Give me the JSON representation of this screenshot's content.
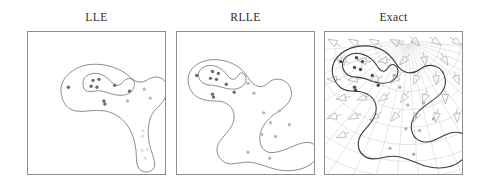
{
  "figure": {
    "width": 483,
    "height": 185,
    "background": "#ffffff",
    "panel_border_color": "#8d8d8d"
  },
  "panels": [
    {
      "id": "lle",
      "title": "LLE"
    },
    {
      "id": "rlle",
      "title": "RLLE"
    },
    {
      "id": "exact",
      "title": "Exact"
    }
  ],
  "chart_data": {
    "type": "scatter",
    "title": "",
    "xlabel": "",
    "ylabel": "",
    "grid": false,
    "legend": "none",
    "subplots": [
      {
        "name": "LLE",
        "xlim": [
          0,
          139
        ],
        "ylim": [
          0,
          144
        ],
        "point_colors": {
          "dark": "#6a6a6a",
          "mid": "#b8b8b8",
          "faint": "#e2e2e2"
        },
        "contours": [
          {
            "name": "outer-contour",
            "path": "M 34 64 C 30 48, 46 35, 62 33 C 80 31, 96 38, 104 46 C 110 52, 116 52, 122 48 C 130 43, 140 46, 141 56 C 142 66, 136 72, 130 78 C 124 84, 122 92, 122 102 C 122 114, 126 122, 128 130 C 130 138, 126 142, 120 142 C 113 142, 110 136, 110 128 C 110 118, 108 108, 104 100 C 98 88, 88 82, 78 80 C 66 78, 56 82, 48 80 C 39 78, 36 72, 34 64 Z"
          },
          {
            "name": "inner-contour",
            "path": "M 56 54 C 54 46, 62 41, 70 42 C 78 43, 82 48, 86 52 C 90 56, 94 54, 97 50 C 101 45, 108 47, 108 53 C 108 59, 103 63, 97 64 C 90 65, 82 62, 76 60 C 70 58, 64 62, 60 60 C 57 59, 56 57, 56 54 Z"
          }
        ],
        "points": [
          {
            "x": 41,
            "y": 56,
            "shade": "dark"
          },
          {
            "x": 66,
            "y": 49,
            "shade": "dark"
          },
          {
            "x": 72,
            "y": 48,
            "shade": "dark"
          },
          {
            "x": 64,
            "y": 55,
            "shade": "dark"
          },
          {
            "x": 70,
            "y": 56,
            "shade": "dark"
          },
          {
            "x": 88,
            "y": 54,
            "shade": "dark"
          },
          {
            "x": 77,
            "y": 70,
            "shade": "dark"
          },
          {
            "x": 78,
            "y": 73,
            "shade": "dark"
          },
          {
            "x": 103,
            "y": 60,
            "shade": "dark"
          },
          {
            "x": 118,
            "y": 58,
            "shade": "mid"
          },
          {
            "x": 124,
            "y": 67,
            "shade": "mid"
          },
          {
            "x": 101,
            "y": 70,
            "shade": "mid"
          },
          {
            "x": 117,
            "y": 100,
            "shade": "faint"
          },
          {
            "x": 116,
            "y": 106,
            "shade": "faint"
          },
          {
            "x": 116,
            "y": 120,
            "shade": "faint"
          },
          {
            "x": 121,
            "y": 119,
            "shade": "faint"
          },
          {
            "x": 119,
            "y": 128,
            "shade": "faint"
          }
        ]
      },
      {
        "name": "RLLE",
        "xlim": [
          0,
          139
        ],
        "ylim": [
          0,
          144
        ],
        "point_colors": {
          "dark": "#6a6a6a",
          "mid": "#b8b8b8",
          "faint": "#d8d8d8"
        },
        "contours": [
          {
            "name": "outer-contour",
            "path": "M 12 54 C 8 38, 22 28, 38 28 C 54 28, 66 36, 72 46 C 78 56, 86 58, 92 52 C 100 44, 114 48, 116 60 C 118 72, 106 78, 98 84 C 88 92, 84 100, 84 108 C 84 118, 90 124, 100 122 C 112 120, 122 112, 132 112 C 142 112, 146 122, 140 130 C 132 140, 116 142, 104 140 C 92 138, 82 132, 72 132 C 62 132, 54 136, 48 132 C 40 127, 38 118, 44 110 C 50 102, 58 96, 58 86 C 58 76, 50 70, 40 70 C 28 70, 16 68, 12 54 Z"
          },
          {
            "name": "inner-contour",
            "path": "M 22 46 C 20 38, 28 33, 36 34 C 44 35, 48 40, 52 45 C 56 50, 60 48, 62 44 C 65 39, 70 42, 70 48 C 70 54, 64 58, 56 58 C 48 58, 42 54, 36 54 C 30 54, 24 52, 22 46 Z"
          }
        ],
        "points": [
          {
            "x": 20,
            "y": 44,
            "shade": "dark"
          },
          {
            "x": 36,
            "y": 40,
            "shade": "dark"
          },
          {
            "x": 42,
            "y": 42,
            "shade": "dark"
          },
          {
            "x": 34,
            "y": 47,
            "shade": "dark"
          },
          {
            "x": 40,
            "y": 48,
            "shade": "dark"
          },
          {
            "x": 50,
            "y": 53,
            "shade": "dark"
          },
          {
            "x": 36,
            "y": 63,
            "shade": "dark"
          },
          {
            "x": 37,
            "y": 66,
            "shade": "dark"
          },
          {
            "x": 58,
            "y": 61,
            "shade": "dark"
          },
          {
            "x": 72,
            "y": 52,
            "shade": "mid"
          },
          {
            "x": 78,
            "y": 62,
            "shade": "mid"
          },
          {
            "x": 88,
            "y": 82,
            "shade": "mid"
          },
          {
            "x": 104,
            "y": 80,
            "shade": "mid"
          },
          {
            "x": 95,
            "y": 92,
            "shade": "mid"
          },
          {
            "x": 114,
            "y": 94,
            "shade": "mid"
          },
          {
            "x": 86,
            "y": 104,
            "shade": "mid"
          },
          {
            "x": 100,
            "y": 106,
            "shade": "mid"
          },
          {
            "x": 72,
            "y": 122,
            "shade": "mid"
          },
          {
            "x": 94,
            "y": 128,
            "shade": "mid"
          }
        ]
      },
      {
        "name": "Exact",
        "xlim": [
          0,
          139
        ],
        "ylim": [
          0,
          144
        ],
        "point_colors": {
          "dark": "#4a4a4a",
          "mid": "#b2b2b2",
          "faint": "#d0d0d0"
        },
        "grid_overlay": {
          "enabled": true,
          "type": "curvilinear-polar",
          "color": "#c9c9c9",
          "focus_x": 84,
          "focus_y": 8,
          "radial_lines": 22,
          "arc_lines": 9
        },
        "vector_field": {
          "enabled": true,
          "glyph": "triangle-arrowhead",
          "color": "#8e8e8e",
          "count": 34
        },
        "contours": [
          {
            "name": "outer-contour",
            "path": "M 8 44 C 4 26, 22 14, 40 14 C 56 14, 66 22, 72 32 C 78 42, 88 44, 96 38 C 106 30, 120 34, 122 48 C 124 62, 110 68, 100 76 C 90 84, 86 92, 88 100 C 90 110, 100 114, 110 110 C 120 106, 128 100, 136 102 C 146 104, 148 116, 142 126 C 134 138, 116 140, 102 136 C 90 132, 80 126, 70 126 C 58 126, 48 132, 40 126 C 32 120, 32 110, 38 102 C 44 94, 52 88, 52 78 C 52 66, 42 60, 30 60 C 18 60, 12 56, 8 44 Z"
          },
          {
            "name": "inner-contour",
            "path": "M 18 36 C 16 26, 26 20, 36 22 C 46 24, 50 30, 54 36 C 58 42, 62 40, 64 36 C 68 30, 74 34, 74 40 C 74 48, 66 52, 58 52 C 48 52, 42 46, 34 46 C 26 46, 20 44, 18 36 Z"
          }
        ],
        "points": [
          {
            "x": 16,
            "y": 30,
            "shade": "dark"
          },
          {
            "x": 32,
            "y": 26,
            "shade": "dark"
          },
          {
            "x": 38,
            "y": 30,
            "shade": "dark"
          },
          {
            "x": 30,
            "y": 36,
            "shade": "dark"
          },
          {
            "x": 36,
            "y": 38,
            "shade": "dark"
          },
          {
            "x": 48,
            "y": 44,
            "shade": "dark"
          },
          {
            "x": 30,
            "y": 56,
            "shade": "dark"
          },
          {
            "x": 31,
            "y": 59,
            "shade": "dark"
          },
          {
            "x": 54,
            "y": 54,
            "shade": "dark"
          },
          {
            "x": 70,
            "y": 44,
            "shade": "mid"
          },
          {
            "x": 76,
            "y": 56,
            "shade": "mid"
          },
          {
            "x": 84,
            "y": 74,
            "shade": "mid"
          },
          {
            "x": 100,
            "y": 72,
            "shade": "mid"
          },
          {
            "x": 92,
            "y": 86,
            "shade": "mid"
          },
          {
            "x": 110,
            "y": 88,
            "shade": "mid"
          },
          {
            "x": 82,
            "y": 98,
            "shade": "mid"
          },
          {
            "x": 96,
            "y": 100,
            "shade": "mid"
          },
          {
            "x": 66,
            "y": 118,
            "shade": "mid"
          },
          {
            "x": 90,
            "y": 124,
            "shade": "mid"
          }
        ]
      }
    ]
  }
}
